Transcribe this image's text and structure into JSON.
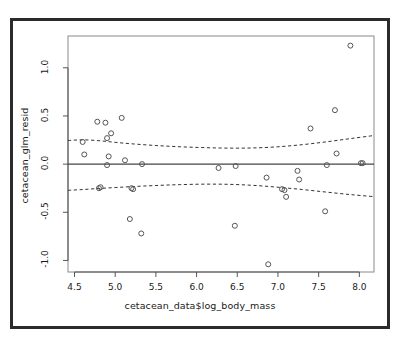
{
  "figure": {
    "background_color": "#ffffff",
    "frame_color": "#2b2b2b",
    "point_color": "#555555",
    "line_color": "#333333",
    "zero_line_color": "#444444"
  },
  "chart_data": {
    "type": "scatter",
    "title": "",
    "xlabel": "cetacean_data$log_body_mass",
    "ylabel": "cetacean_glm_resid",
    "xlim": [
      4.42,
      8.18
    ],
    "ylim": [
      -1.12,
      1.33
    ],
    "xticks": [
      4.5,
      5.0,
      5.5,
      6.0,
      6.5,
      7.0,
      7.5,
      8.0
    ],
    "xtick_labels": [
      "4.5",
      "5.0",
      "5.5",
      "6.0",
      "6.5",
      "7.0",
      "7.5",
      "8.0"
    ],
    "yticks": [
      -1.0,
      -0.5,
      0.0,
      0.5,
      1.0
    ],
    "ytick_labels": [
      "-1.0",
      "-0.5",
      "0.0",
      "0.5",
      "1.0"
    ],
    "grid": false,
    "legend": null,
    "x": [
      4.6,
      4.62,
      4.78,
      4.8,
      4.82,
      4.88,
      4.9,
      4.9,
      4.92,
      4.95,
      5.08,
      5.12,
      5.18,
      5.2,
      5.22,
      5.32,
      5.33,
      6.27,
      6.47,
      6.48,
      6.86,
      6.88,
      7.05,
      7.08,
      7.1,
      7.24,
      7.26,
      7.4,
      7.58,
      7.6,
      7.7,
      7.72,
      7.89,
      8.02,
      8.04
    ],
    "y": [
      0.23,
      0.1,
      0.44,
      -0.25,
      -0.24,
      0.43,
      0.27,
      -0.01,
      0.08,
      0.32,
      0.48,
      0.04,
      -0.57,
      -0.25,
      -0.26,
      -0.72,
      0.0,
      -0.04,
      -0.64,
      -0.02,
      -0.14,
      -1.04,
      -0.26,
      -0.27,
      -0.34,
      -0.07,
      -0.16,
      0.37,
      -0.49,
      -0.01,
      0.56,
      0.11,
      1.23,
      0.01,
      0.01
    ],
    "series": [
      {
        "name": "residuals",
        "marker": "open-circle",
        "values": [
          0.23,
          0.1,
          0.44,
          -0.25,
          -0.24,
          0.43,
          0.27,
          -0.01,
          0.08,
          0.32,
          0.48,
          0.04,
          -0.57,
          -0.25,
          -0.26,
          -0.72,
          0.0,
          -0.04,
          -0.64,
          -0.02,
          -0.14,
          -1.04,
          -0.26,
          -0.27,
          -0.34,
          -0.07,
          -0.16,
          0.37,
          -0.49,
          -0.01,
          0.56,
          0.11,
          1.23,
          0.01,
          0.01
        ]
      }
    ],
    "reference_lines": [
      {
        "name": "zero-line",
        "style": "solid",
        "y": 0.0
      }
    ],
    "envelope_bands": [
      {
        "name": "upper-band",
        "style": "dashed",
        "x": [
          4.42,
          4.6,
          4.8,
          5.0,
          5.2,
          5.5,
          5.8,
          6.1,
          6.4,
          6.7,
          7.0,
          7.3,
          7.6,
          7.9,
          8.18
        ],
        "y": [
          0.245,
          0.252,
          0.243,
          0.226,
          0.211,
          0.193,
          0.18,
          0.171,
          0.166,
          0.168,
          0.18,
          0.202,
          0.232,
          0.266,
          0.297
        ]
      },
      {
        "name": "lower-band",
        "style": "dashed",
        "x": [
          4.42,
          4.6,
          4.8,
          5.0,
          5.2,
          5.5,
          5.8,
          6.1,
          6.4,
          6.7,
          7.0,
          7.3,
          7.6,
          7.9,
          8.18
        ],
        "y": [
          -0.272,
          -0.264,
          -0.253,
          -0.243,
          -0.234,
          -0.222,
          -0.213,
          -0.208,
          -0.21,
          -0.221,
          -0.24,
          -0.264,
          -0.291,
          -0.317,
          -0.338
        ]
      }
    ]
  }
}
